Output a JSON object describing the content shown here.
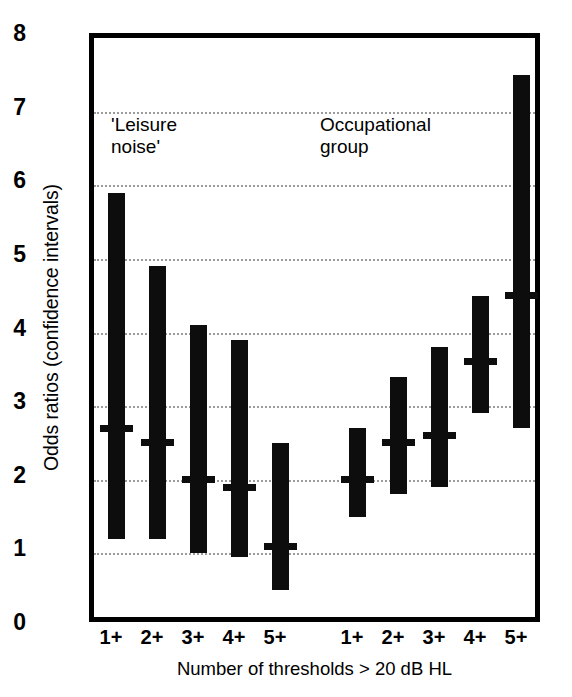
{
  "chart_data": {
    "type": "bar",
    "title": "",
    "xlabel": "Number of thresholds > 20 dB HL",
    "ylabel": "Odds ratios (confidence intervals)",
    "ylim": [
      0,
      8
    ],
    "yticks": [
      0,
      1,
      2,
      3,
      4,
      5,
      6,
      7,
      8
    ],
    "ytick_labels": [
      "0",
      "1",
      "2",
      "3",
      "4",
      "5",
      "6",
      "7",
      "8"
    ],
    "grid": true,
    "grid_style": "dotted-horizontal",
    "legend": "none",
    "annotations": [
      {
        "id": "leisure",
        "text": "'Leisure\nnoise'"
      },
      {
        "id": "occupational",
        "text": "Occupational\ngroup"
      }
    ],
    "categories": [
      "1+",
      "2+",
      "3+",
      "4+",
      "5+"
    ],
    "groups": [
      {
        "name": "'Leisure noise'",
        "points": [
          {
            "category": "1+",
            "estimate": 2.7,
            "low": 1.2,
            "high": 5.9
          },
          {
            "category": "2+",
            "estimate": 2.5,
            "low": 1.2,
            "high": 4.9
          },
          {
            "category": "3+",
            "estimate": 2.0,
            "low": 1.0,
            "high": 4.1
          },
          {
            "category": "4+",
            "estimate": 1.9,
            "low": 0.95,
            "high": 3.9
          },
          {
            "category": "5+",
            "estimate": 1.1,
            "low": 0.5,
            "high": 2.5
          }
        ]
      },
      {
        "name": "Occupational group",
        "points": [
          {
            "category": "1+",
            "estimate": 2.0,
            "low": 1.5,
            "high": 2.7
          },
          {
            "category": "2+",
            "estimate": 2.5,
            "low": 1.8,
            "high": 3.4
          },
          {
            "category": "3+",
            "estimate": 2.6,
            "low": 1.9,
            "high": 3.8
          },
          {
            "category": "4+",
            "estimate": 3.6,
            "low": 2.9,
            "high": 4.5
          },
          {
            "category": "5+",
            "estimate": 4.5,
            "low": 2.7,
            "high": 7.5
          }
        ]
      }
    ],
    "bar_color": "#0d0d0d",
    "grid_color": "#9a9a9a",
    "axis_color": "#000000",
    "x_positions": {
      "leisure": [
        111,
        152,
        193,
        234,
        275
      ],
      "occupational": [
        352,
        393,
        434,
        475,
        516
      ]
    }
  }
}
